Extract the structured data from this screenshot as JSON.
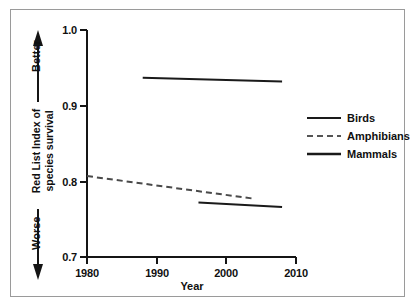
{
  "chart_data": {
    "type": "line",
    "title": "",
    "xlabel": "Year",
    "ylabel": "Red List Index of species survival",
    "ylabel_line1": "Red List Index of",
    "ylabel_line2": "species survival",
    "xlim": [
      1980,
      2010
    ],
    "ylim": [
      0.7,
      1.0
    ],
    "xticks": [
      "1980",
      "1990",
      "2000",
      "2010"
    ],
    "xtick_values": [
      1980,
      1990,
      2000,
      2010
    ],
    "yticks": [
      "1.0",
      "0.9",
      "0.8",
      "0.7"
    ],
    "ytick_values": [
      1.0,
      0.9,
      0.8,
      0.7
    ],
    "grid": false,
    "legend_position": "right",
    "series": [
      {
        "name": "Birds",
        "style": "solid",
        "color": "#1a1a1a",
        "x": [
          1988,
          2008
        ],
        "y": [
          0.937,
          0.932
        ]
      },
      {
        "name": "Amphibians",
        "style": "dashed",
        "color": "#4a4a4a",
        "x": [
          1980,
          2004
        ],
        "y": [
          0.807,
          0.777
        ]
      },
      {
        "name": "Mammals",
        "style": "solid",
        "color": "#1a1a1a",
        "x": [
          1996,
          2008
        ],
        "y": [
          0.772,
          0.766
        ]
      }
    ],
    "annotations": [
      {
        "text": "Better",
        "direction": "up",
        "position": "axis-left-top"
      },
      {
        "text": "Worse",
        "direction": "down",
        "position": "axis-left-bottom"
      }
    ]
  },
  "legend": {
    "items": [
      {
        "label": "Birds"
      },
      {
        "label": "Amphibians"
      },
      {
        "label": "Mammals"
      }
    ]
  },
  "axes": {
    "y": {
      "tick_0": "1.0",
      "tick_1": "0.9",
      "tick_2": "0.8",
      "tick_3": "0.7"
    },
    "x": {
      "tick_0": "1980",
      "tick_1": "1990",
      "tick_2": "2000",
      "tick_3": "2010",
      "title": "Year"
    }
  },
  "annotations": {
    "better": "Better",
    "worse": "Worse"
  }
}
